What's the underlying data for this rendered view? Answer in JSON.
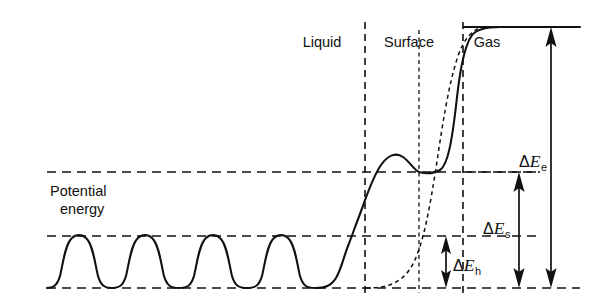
{
  "figure": {
    "axis_label_line1": "Potential",
    "axis_label_line2": "energy"
  },
  "regions": [
    {
      "id": "liquid",
      "label": "Liquid",
      "x": 322,
      "y": 47
    },
    {
      "id": "surface",
      "label": "Surface",
      "x": 400,
      "y": 47
    },
    {
      "id": "gas",
      "label": "Gas",
      "x": 478,
      "y": 47
    }
  ],
  "energies": [
    {
      "id": "delta-e-e",
      "delta": "Δ",
      "symbol": "E",
      "subscript": "e",
      "label": "ΔEₑ",
      "meaning": "evaporation energy",
      "label_x": 519,
      "label_y": 160,
      "arrow_x": 551,
      "arrow_top": 27,
      "arrow_bottom": 288,
      "double_headed": true
    },
    {
      "id": "delta-e-s",
      "delta": "Δ",
      "symbol": "E",
      "subscript": "s",
      "label": "ΔEₛ",
      "meaning": "surface energy",
      "label_x": 487,
      "label_y": 229,
      "arrow_x": 519,
      "arrow_top": 172,
      "arrow_bottom": 288,
      "double_headed": true
    },
    {
      "id": "delta-e-h",
      "delta": "Δ",
      "symbol": "E",
      "subscript": "h",
      "label": "ΔEₕ",
      "meaning": "hole / activation energy",
      "label_x": 458,
      "label_y": 268,
      "arrow_x": 446,
      "arrow_top": 236,
      "arrow_bottom": 288,
      "double_headed": true
    }
  ],
  "levels": [
    {
      "id": "gas-plateau-level",
      "y": 27,
      "x1": 463,
      "x2": 580,
      "style": "solid"
    },
    {
      "id": "surface-level",
      "y": 172,
      "x1": 47,
      "x2": 540,
      "style": "dashed"
    },
    {
      "id": "wave-crest-level",
      "y": 236,
      "x1": 47,
      "x2": 540,
      "style": "dashed"
    },
    {
      "id": "baseline-level",
      "y": 288,
      "x1": 47,
      "x2": 580,
      "style": "dashed"
    }
  ],
  "boundaries": [
    {
      "id": "liquid-surface-boundary",
      "x": 365,
      "y1": 22,
      "y2": 293,
      "style": "dashed"
    },
    {
      "id": "surface-gas-boundary",
      "x": 463,
      "y1": 22,
      "y2": 293,
      "style": "dashed"
    },
    {
      "id": "inner-surface-marker",
      "x": 419,
      "y1": 30,
      "y2": 293,
      "style": "fine-dashed"
    }
  ],
  "curves": {
    "potential_well_wave": {
      "id": "periodic-potential-wave",
      "style": "solid",
      "description": "Periodic oscillating potential wells in the liquid bulk",
      "crest_y": 236,
      "trough_y": 288,
      "period_count": 4,
      "x_start": 47,
      "x_end": 358
    },
    "surface_rise": {
      "id": "surface-barrier-curve",
      "style": "solid",
      "description": "Rise from liquid trough through surface hump to gas plateau",
      "hump_peak_y": 155,
      "hump_dip_y": 172,
      "plateau_y": 27
    },
    "smooth_transition": {
      "id": "smoothed-potential-dashed-curve",
      "style": "dashed",
      "description": "Smoothed (averaged) potential energy profile from liquid to gas"
    }
  },
  "colors": {
    "ink": "#111111",
    "background": "#ffffff"
  }
}
